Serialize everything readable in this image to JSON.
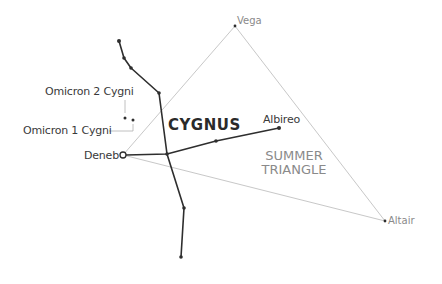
{
  "diagram": {
    "title": "CYGNUS",
    "region_label": {
      "line1": "SUMMER",
      "line2": "TRIANGLE"
    },
    "colors": {
      "constellation_line": "#2e2e2e",
      "triangle_line": "#c8c8c8",
      "star_label": "#3a3a3a",
      "triangle_label": "#8a8a8a",
      "leader_line": "#b0b0b0"
    },
    "stars": [
      {
        "name": "Vega",
        "x": 235,
        "y": 26,
        "type": "triangle-vertex"
      },
      {
        "name": "Altair",
        "x": 385,
        "y": 221,
        "type": "triangle-vertex"
      },
      {
        "name": "Deneb",
        "x": 123,
        "y": 155,
        "type": "open-circle"
      },
      {
        "name": "Albireo",
        "x": 279,
        "y": 128,
        "type": "dot"
      },
      {
        "name": "Omicron 2 Cygni",
        "x": 125,
        "y": 118,
        "type": "dot"
      },
      {
        "name": "Omicron 1 Cygni",
        "x": 133,
        "y": 120,
        "type": "dot"
      }
    ],
    "labels": {
      "vega": "Vega",
      "altair": "Altair",
      "deneb": "Deneb",
      "albireo": "Albireo",
      "omicron2": "Omicron 2 Cygni",
      "omicron1": "Omicron 1 Cygni"
    },
    "constellation_lines": [
      [
        [
          119,
          41
        ],
        [
          124,
          58
        ],
        [
          131,
          68
        ],
        [
          159,
          93
        ],
        [
          167,
          154
        ],
        [
          184,
          208
        ],
        [
          181,
          257
        ]
      ],
      [
        [
          123,
          155
        ],
        [
          167,
          154
        ],
        [
          216,
          141
        ],
        [
          279,
          128
        ]
      ]
    ],
    "triangle": [
      [
        235,
        26
      ],
      [
        385,
        221
      ],
      [
        123,
        155
      ]
    ]
  }
}
